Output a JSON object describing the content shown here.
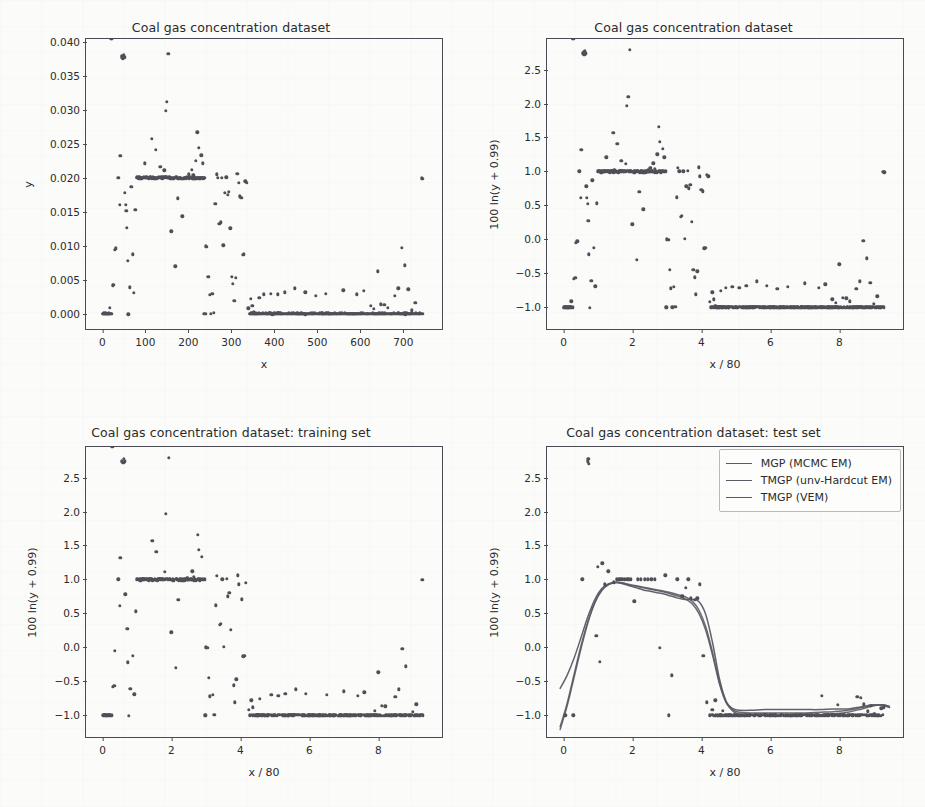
{
  "figure": {
    "background": "#fbfbf9",
    "marker_color": "#4f4f58",
    "axis_color": "#4a4a52"
  },
  "panels": [
    {
      "id": "top-left",
      "title": "Coal gas concentration dataset",
      "xlabel": "x",
      "ylabel": "y",
      "xticks": [
        "0",
        "100",
        "200",
        "300",
        "400",
        "500",
        "600",
        "700"
      ],
      "yticks": [
        "0.000",
        "0.005",
        "0.010",
        "0.015",
        "0.020",
        "0.025",
        "0.030",
        "0.035",
        "0.040"
      ]
    },
    {
      "id": "top-right",
      "title": "Coal gas concentration dataset",
      "xlabel": "x / 80",
      "ylabel": "100 ln(y + 0.99)",
      "xticks": [
        "0",
        "2",
        "4",
        "6",
        "8"
      ],
      "yticks": [
        "-1.0",
        "-0.5",
        "0.0",
        "0.5",
        "1.0",
        "1.5",
        "2.0",
        "2.5"
      ]
    },
    {
      "id": "bottom-left",
      "title": "Coal gas concentration dataset: training set",
      "xlabel": "x / 80",
      "ylabel": "100 ln(y + 0.99)",
      "xticks": [
        "0",
        "2",
        "4",
        "6",
        "8"
      ],
      "yticks": [
        "-1.0",
        "-0.5",
        "0.0",
        "0.5",
        "1.0",
        "1.5",
        "2.0",
        "2.5"
      ]
    },
    {
      "id": "bottom-right",
      "title": "Coal gas concentration dataset: test set",
      "xlabel": "x / 80",
      "ylabel": "100 ln(y + 0.99)",
      "xticks": [
        "0",
        "2",
        "4",
        "6",
        "8"
      ],
      "yticks": [
        "-1.0",
        "-0.5",
        "0.0",
        "0.5",
        "1.0",
        "1.5",
        "2.0",
        "2.5"
      ]
    }
  ],
  "legend": {
    "entries": [
      {
        "label": "MGP (MCMC EM)",
        "color": "#5a5a64"
      },
      {
        "label": "TMGP (unv-Hardcut EM)",
        "color": "#5a5a64"
      },
      {
        "label": "TMGP (VEM)",
        "color": "#5a5a64"
      }
    ]
  },
  "chart_data": [
    {
      "type": "scatter",
      "panel": "top-left",
      "title": "Coal gas concentration dataset",
      "xlabel": "x",
      "ylabel": "y",
      "xlim": [
        -38,
        790
      ],
      "ylim": [
        -0.0022,
        0.0405
      ],
      "grid": false,
      "legend": null,
      "xticks": [
        0,
        100,
        200,
        300,
        400,
        500,
        600,
        700
      ],
      "yticks": [
        0.0,
        0.005,
        0.01,
        0.015,
        0.02,
        0.025,
        0.03,
        0.035,
        0.04
      ],
      "note": "Same data as top-right but on raw y scale; y = exp(v/100) - 0.99 where v is the transformed value.",
      "transform": {
        "from_panel": "top-right",
        "formula": "y = exp(v/100) - 0.99"
      }
    },
    {
      "type": "scatter",
      "panel": "top-right",
      "title": "Coal gas concentration dataset",
      "xlabel": "x / 80",
      "ylabel": "100 ln(y + 0.99)",
      "xlim": [
        -0.48,
        9.85
      ],
      "ylim": [
        -1.32,
        2.95
      ],
      "grid": false,
      "legend": null,
      "xticks": [
        0,
        2,
        4,
        6,
        8
      ],
      "yticks": [
        -1.0,
        -0.5,
        0.0,
        0.5,
        1.0,
        1.5,
        2.0,
        2.5
      ],
      "x": [
        0.02,
        0.06,
        0.1,
        0.14,
        0.18,
        0.22,
        0.26,
        0.3,
        0.34,
        0.36,
        0.4,
        0.46,
        0.5,
        0.52,
        0.56,
        0.58,
        0.6,
        0.62,
        0.64,
        0.66,
        0.68,
        0.7,
        0.72,
        0.74,
        0.76,
        0.8,
        0.84,
        0.88,
        0.92,
        0.96,
        1.0,
        1.04,
        1.08,
        1.12,
        1.16,
        1.2,
        1.24,
        1.28,
        1.32,
        1.36,
        1.4,
        1.44,
        1.48,
        1.52,
        1.56,
        1.6,
        1.64,
        1.68,
        1.72,
        1.76,
        1.8,
        1.84,
        1.88,
        1.92,
        1.96,
        2.0,
        2.04,
        2.08,
        2.12,
        2.16,
        2.2,
        2.24,
        2.28,
        2.32,
        2.36,
        2.4,
        2.44,
        2.48,
        2.52,
        2.56,
        2.6,
        2.64,
        2.68,
        2.72,
        2.76,
        2.8,
        2.84,
        2.88,
        2.92,
        2.96,
        3.0,
        3.04,
        3.08,
        3.12,
        3.16,
        3.2,
        3.24,
        3.28,
        3.32,
        3.36,
        3.4,
        3.44,
        3.48,
        3.52,
        3.56,
        3.6,
        3.64,
        3.68,
        3.72,
        3.76,
        3.8,
        3.84,
        3.88,
        3.92,
        3.96,
        4.0,
        4.04,
        4.08,
        4.12,
        4.16,
        4.2,
        4.24,
        4.28,
        4.32,
        4.36,
        4.4,
        4.44,
        4.48,
        4.52,
        4.56,
        4.6,
        4.7,
        4.8,
        4.9,
        5.0,
        5.1,
        5.2,
        5.3,
        5.4,
        5.5,
        5.6,
        5.7,
        5.8,
        5.9,
        6.0,
        6.1,
        6.2,
        6.3,
        6.4,
        6.5,
        6.6,
        6.7,
        6.8,
        6.9,
        7.0,
        7.1,
        7.2,
        7.3,
        7.4,
        7.5,
        7.6,
        7.7,
        7.8,
        7.9,
        8.0,
        8.1,
        8.2,
        8.3,
        8.4,
        8.5,
        8.6,
        8.7,
        8.8,
        8.9,
        9.0,
        9.1,
        9.2,
        9.3
      ],
      "y": [
        -1.0,
        -1.0,
        -1.0,
        -1.0,
        -1.0,
        -0.91,
        -1.0,
        -0.58,
        -0.57,
        -0.05,
        -0.03,
        1.0,
        0.61,
        1.32,
        2.74,
        2.76,
        2.72,
        2.78,
        2.74,
        0.78,
        0.61,
        0.52,
        0.27,
        -0.22,
        -1.01,
        -0.61,
        0.87,
        -0.12,
        -0.69,
        0.53,
        1.0,
        1.0,
        1.01,
        1.0,
        1.0,
        1.0,
        1.21,
        1.0,
        1.0,
        1.0,
        1.0,
        1.57,
        1.0,
        1.0,
        1.41,
        1.0,
        1.0,
        1.16,
        1.0,
        1.0,
        1.11,
        1.97,
        2.1,
        2.79,
        1.0,
        0.22,
        1.0,
        1.0,
        -0.3,
        1.0,
        0.7,
        1.0,
        1.0,
        0.44,
        1.0,
        1.0,
        1.0,
        1.0,
        1.05,
        1.0,
        1.12,
        1.04,
        1.0,
        1.25,
        1.66,
        1.44,
        1.0,
        1.33,
        1.21,
        1.0,
        0.0,
        -0.01,
        -0.45,
        -0.72,
        -1.0,
        -0.7,
        -0.99,
        0.62,
        1.05,
        1.0,
        0.33,
        0.35,
        1.0,
        0.01,
        0.78,
        1.01,
        0.75,
        0.8,
        0.26,
        -0.45,
        -0.56,
        -0.81,
        -0.47,
        1.06,
        0.93,
        0.73,
        0.71,
        -0.13,
        -0.12,
        0.95,
        0.93,
        -0.92,
        -1.0,
        -0.78,
        -0.88,
        -0.98,
        -1.0,
        -1.0,
        -1.0,
        -0.76,
        -1.0,
        -0.71,
        -1.0,
        -0.7,
        -1.0,
        -0.71,
        -1.0,
        -0.68,
        -1.0,
        -1.0,
        -0.62,
        -1.0,
        -1.0,
        -0.68,
        -1.0,
        -1.0,
        -0.73,
        -1.0,
        -1.0,
        -0.7,
        -1.0,
        -1.0,
        -1.0,
        -1.0,
        -0.65,
        -1.0,
        -1.0,
        -1.0,
        -0.71,
        -1.0,
        -0.66,
        -1.0,
        -0.88,
        -0.93,
        -0.37,
        -0.86,
        -0.87,
        -0.91,
        -1.0,
        -0.73,
        -0.62,
        -0.02,
        -0.28,
        -0.64,
        -0.95,
        -0.84
      ]
    },
    {
      "type": "scatter",
      "panel": "bottom-left",
      "title": "Coal gas concentration dataset: training set",
      "xlabel": "x / 80",
      "ylabel": "100 ln(y + 0.99)",
      "xlim": [
        -0.48,
        9.85
      ],
      "ylim": [
        -1.32,
        2.95
      ],
      "grid": false,
      "legend": null,
      "xticks": [
        0,
        2,
        4,
        6,
        8
      ],
      "yticks": [
        -1.0,
        -0.5,
        0.0,
        0.5,
        1.0,
        1.5,
        2.0,
        2.5
      ],
      "note": "A random ~80% subsample of the full dataset."
    },
    {
      "type": "scatter+line",
      "panel": "bottom-right",
      "title": "Coal gas concentration dataset: test set",
      "xlabel": "x / 80",
      "ylabel": "100 ln(y + 0.99)",
      "xlim": [
        -0.48,
        9.85
      ],
      "ylim": [
        -1.32,
        2.95
      ],
      "grid": false,
      "legend_position": "upper right",
      "xticks": [
        0,
        2,
        4,
        6,
        8
      ],
      "yticks": [
        -1.0,
        -0.5,
        0.0,
        0.5,
        1.0,
        1.5,
        2.0,
        2.5
      ],
      "note": "Held-out ~20% subsample plus three fitted predictive mean curves.",
      "series": [
        {
          "name": "MGP (MCMC EM)",
          "color": "#5a5a64",
          "x": [
            -0.1,
            0.1,
            0.3,
            0.5,
            0.7,
            0.9,
            1.1,
            1.3,
            1.5,
            1.7,
            1.9,
            2.1,
            2.3,
            2.5,
            2.7,
            2.9,
            3.1,
            3.3,
            3.5,
            3.7,
            3.9,
            4.1,
            4.3,
            4.5,
            4.7,
            4.9,
            5.1,
            5.4,
            5.8,
            6.2,
            6.6,
            7.0,
            7.4,
            7.8,
            8.2,
            8.6,
            8.9,
            9.2,
            9.4
          ],
          "values": [
            -1.14,
            -0.8,
            -0.38,
            0.04,
            0.4,
            0.68,
            0.86,
            0.94,
            0.97,
            0.96,
            0.93,
            0.91,
            0.89,
            0.87,
            0.85,
            0.83,
            0.8,
            0.77,
            0.73,
            0.66,
            0.52,
            0.27,
            -0.1,
            -0.52,
            -0.8,
            -0.9,
            -0.93,
            -0.94,
            -0.94,
            -0.94,
            -0.94,
            -0.94,
            -0.93,
            -0.92,
            -0.9,
            -0.86,
            -0.83,
            -0.82,
            -0.84
          ]
        },
        {
          "name": "TMGP (unv-Hardcut EM)",
          "color": "#5a5a64",
          "x": [
            -0.1,
            0.1,
            0.3,
            0.5,
            0.7,
            0.9,
            1.1,
            1.3,
            1.5,
            1.7,
            1.9,
            2.1,
            2.3,
            2.5,
            2.7,
            2.9,
            3.1,
            3.3,
            3.5,
            3.7,
            3.9,
            4.1,
            4.3,
            4.5,
            4.7,
            4.9,
            5.1,
            5.4,
            5.8,
            6.2,
            6.6,
            7.0,
            7.4,
            7.8,
            8.2,
            8.6,
            8.9,
            9.2,
            9.4
          ],
          "values": [
            -0.58,
            -0.39,
            -0.14,
            0.16,
            0.47,
            0.72,
            0.88,
            0.95,
            0.97,
            0.95,
            0.92,
            0.89,
            0.86,
            0.84,
            0.82,
            0.8,
            0.77,
            0.74,
            0.72,
            0.72,
            0.69,
            0.5,
            0.08,
            -0.45,
            -0.78,
            -0.88,
            -0.9,
            -0.9,
            -0.89,
            -0.89,
            -0.89,
            -0.89,
            -0.89,
            -0.88,
            -0.88,
            -0.85,
            -0.82,
            -0.83,
            -0.86
          ]
        },
        {
          "name": "TMGP (VEM)",
          "color": "#5a5a64",
          "x": [
            -0.1,
            0.1,
            0.3,
            0.5,
            0.7,
            0.9,
            1.1,
            1.3,
            1.5,
            1.7,
            1.9,
            2.1,
            2.3,
            2.5,
            2.7,
            2.9,
            3.1,
            3.3,
            3.5,
            3.7,
            3.9,
            4.1,
            4.3,
            4.5,
            4.7,
            4.9,
            5.1,
            5.4,
            5.8,
            6.2,
            6.6,
            7.0,
            7.4,
            7.8,
            8.2,
            8.6,
            8.9,
            9.2,
            9.4
          ],
          "values": [
            -1.18,
            -0.84,
            -0.42,
            0.0,
            0.38,
            0.67,
            0.85,
            0.94,
            0.97,
            0.96,
            0.94,
            0.92,
            0.9,
            0.88,
            0.86,
            0.84,
            0.82,
            0.79,
            0.76,
            0.7,
            0.57,
            0.32,
            -0.06,
            -0.5,
            -0.79,
            -0.92,
            -0.96,
            -0.97,
            -0.97,
            -0.97,
            -0.97,
            -0.97,
            -0.96,
            -0.95,
            -0.93,
            -0.88,
            -0.84,
            -0.82,
            -0.85
          ]
        }
      ],
      "points_x": [
        0.05,
        0.28,
        0.55,
        0.7,
        0.72,
        0.74,
        0.95,
        1.0,
        1.05,
        1.12,
        1.2,
        1.3,
        1.45,
        1.55,
        1.6,
        1.65,
        1.7,
        1.78,
        1.85,
        1.9,
        1.95,
        2.05,
        2.15,
        2.25,
        2.35,
        2.45,
        2.55,
        2.65,
        2.8,
        2.95,
        3.05,
        3.15,
        3.3,
        3.45,
        3.55,
        3.62,
        3.7,
        3.8,
        3.88,
        3.95,
        4.05,
        4.15,
        4.25,
        4.32,
        4.4,
        4.48,
        4.55,
        4.62,
        4.7,
        4.78,
        4.85,
        4.95,
        5.05,
        5.15,
        5.25,
        5.4,
        5.55,
        5.7,
        5.85,
        6.0,
        6.15,
        6.3,
        6.45,
        6.6,
        6.75,
        6.9,
        7.05,
        7.2,
        7.35,
        7.5,
        7.65,
        7.8,
        7.95,
        8.1,
        8.25,
        8.4,
        8.52,
        8.62,
        8.72,
        8.82,
        8.92,
        9.02,
        9.12,
        9.22,
        9.3
      ],
      "points_y": [
        -1.0,
        -1.0,
        1.0,
        2.74,
        2.78,
        2.7,
        0.17,
        1.19,
        -0.21,
        1.24,
        0.93,
        1.12,
        0.96,
        1.0,
        1.0,
        1.0,
        1.0,
        1.0,
        1.0,
        1.0,
        1.0,
        0.68,
        1.0,
        1.0,
        1.0,
        1.0,
        1.0,
        1.0,
        -0.01,
        1.06,
        -1.0,
        -0.41,
        1.0,
        0.75,
        0.88,
        1.0,
        0.72,
        0.7,
        0.72,
        0.93,
        -0.12,
        -0.81,
        -1.0,
        -0.92,
        -0.78,
        -1.0,
        -1.0,
        -0.93,
        -1.0,
        -1.0,
        -1.0,
        -1.0,
        -1.0,
        -1.0,
        -1.0,
        -1.0,
        -1.0,
        -1.0,
        -1.0,
        -1.0,
        -1.0,
        -1.0,
        -1.0,
        -1.0,
        -1.0,
        -1.0,
        -1.0,
        -1.0,
        -1.0,
        -0.71,
        -1.0,
        -1.0,
        -0.85,
        -1.0,
        -1.0,
        -1.0,
        -0.73,
        -0.74,
        -0.84,
        -0.94,
        -0.86,
        -0.98,
        -1.0,
        -0.9,
        -0.88
      ]
    }
  ]
}
